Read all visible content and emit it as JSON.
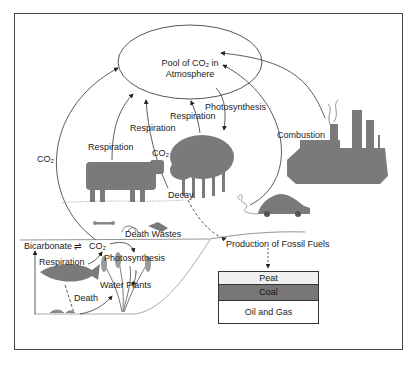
{
  "diagram": {
    "atmosphere_pool": "Pool of CO₂ in Atmosphere",
    "labels": {
      "co2_left": "CO₂",
      "respiration_cow": "Respiration",
      "respiration_center": "Respiration",
      "co2_center": "CO₂",
      "respiration_tree": "Respiration",
      "photosynthesis_tree": "Photosynthesis",
      "combustion": "Combustion",
      "decay": "Decay",
      "death_wastes": "Death Wastes",
      "bicarbonate": "Bicarbonate",
      "equilibrium": "⇌",
      "co2_water": "CO₂",
      "respiration_water": "Respiration",
      "photosynthesis_water": "Photosynthesis",
      "water_plants": "Water Plants",
      "death": "Death",
      "production_fossil_fuels": "Production of Fossil Fuels"
    },
    "fossil_fuel_layers": [
      {
        "label": "Peat",
        "color": "#f0f0ee"
      },
      {
        "label": "Coal",
        "color": "#777777"
      },
      {
        "label": "Oil and Gas",
        "color": "#ffffff"
      }
    ],
    "colors": {
      "silhouette": "#7a7a7a",
      "line": "#333333"
    }
  }
}
